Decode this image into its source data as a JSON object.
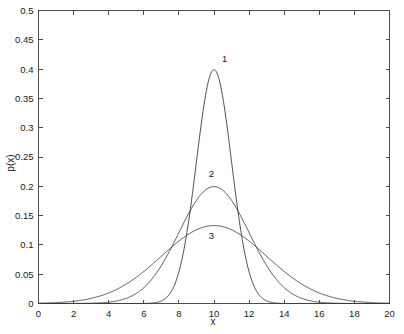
{
  "chart_data": {
    "type": "line",
    "title": "",
    "xlabel": "x",
    "ylabel": "p(x)",
    "xlim": [
      0,
      20
    ],
    "ylim": [
      0,
      0.5
    ],
    "grid": false,
    "legend_position": "inline-annotations",
    "xticks": [
      0,
      2,
      4,
      6,
      8,
      10,
      12,
      14,
      16,
      18,
      20
    ],
    "xtick_labels": [
      "0",
      "2",
      "4",
      "6",
      "8",
      "10",
      "12",
      "14",
      "16",
      "18",
      "20"
    ],
    "yticks": [
      0,
      0.05,
      0.1,
      0.15,
      0.2,
      0.25,
      0.3,
      0.35,
      0.4,
      0.45,
      0.5
    ],
    "ytick_labels": [
      "0",
      "0.05",
      "0.1",
      "0.15",
      "0.2",
      "0.25",
      "0.3",
      "0.35",
      "0.4",
      "0.45",
      "0.5"
    ],
    "series": [
      {
        "name": "1",
        "label": "1",
        "distribution": "gaussian",
        "mean": 10,
        "sigma": 1,
        "peak_value": 0.3989,
        "color": "#3a3a3a",
        "annotation": {
          "text": "1",
          "x": 10.6,
          "y": 0.4125
        },
        "x": [
          0,
          0.5,
          1,
          1.5,
          2,
          2.5,
          3,
          3.5,
          4,
          4.5,
          5,
          5.5,
          6,
          6.5,
          7,
          7.5,
          8,
          8.5,
          9,
          9.5,
          10,
          10.5,
          11,
          11.5,
          12,
          12.5,
          13,
          13.5,
          14,
          14.5,
          15,
          15.5,
          16,
          16.5,
          17,
          17.5,
          18,
          18.5,
          19,
          19.5,
          20
        ],
        "values": [
          0.0,
          0.0,
          0.0,
          0.0,
          0.0,
          0.0,
          0.0,
          0.0,
          0.0001,
          0.0004,
          0.0,
          0.0,
          0.0001,
          0.0004,
          0.0044,
          0.0175,
          0.054,
          0.1295,
          0.242,
          0.3521,
          0.3989,
          0.3521,
          0.242,
          0.1295,
          0.054,
          0.0175,
          0.0044,
          0.0009,
          0.0001,
          0.0,
          0.0,
          0.0,
          0.0,
          0.0,
          0.0,
          0.0,
          0.0,
          0.0,
          0.0,
          0.0,
          0.0
        ]
      },
      {
        "name": "2",
        "label": "2",
        "distribution": "gaussian",
        "mean": 10,
        "sigma": 2,
        "peak_value": 0.1995,
        "color": "#3a3a3a",
        "annotation": {
          "text": "2",
          "x": 9.85,
          "y": 0.2155
        },
        "x": [
          0,
          1,
          2,
          3,
          4,
          5,
          6,
          7,
          8,
          9,
          10,
          11,
          12,
          13,
          14,
          15,
          16,
          17,
          18,
          19,
          20
        ],
        "values": [
          0.0,
          0.0,
          0.0001,
          0.0002,
          0.0022,
          0.0088,
          0.027,
          0.0648,
          0.121,
          0.176,
          0.1995,
          0.176,
          0.121,
          0.0648,
          0.027,
          0.0088,
          0.0022,
          0.0004,
          0.0001,
          0.0,
          0.0
        ]
      },
      {
        "name": "3",
        "label": "3",
        "distribution": "gaussian",
        "mean": 10,
        "sigma": 3,
        "peak_value": 0.133,
        "color": "#3a3a3a",
        "annotation": {
          "text": "3",
          "x": 9.85,
          "y": 0.1105
        },
        "x": [
          0,
          1,
          2,
          3,
          4,
          5,
          6,
          7,
          8,
          9,
          10,
          11,
          12,
          13,
          14,
          15,
          16,
          17,
          18,
          19,
          20
        ],
        "values": [
          0.0012,
          0.0037,
          0.0091,
          0.018,
          0.0297,
          0.0425,
          0.0547,
          0.0658,
          0.0759,
          0.0839,
          0.133,
          0.0839,
          0.0759,
          0.0658,
          0.0547,
          0.0425,
          0.0297,
          0.018,
          0.0091,
          0.0037,
          0.0012
        ]
      }
    ]
  }
}
